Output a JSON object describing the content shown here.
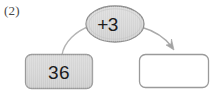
{
  "figure": {
    "type": "function-machine-diagram",
    "item_number": "(2)",
    "operator": {
      "label": "+3",
      "shape": "ellipse",
      "fill_color": "#d6d6d6",
      "border_color": "#8e8e8e"
    },
    "input_box": {
      "label": "36",
      "shape": "rounded-rectangle",
      "fill_color": "#d4d4d4",
      "border_color": "#9a9a9a"
    },
    "output_box": {
      "label": "",
      "shape": "rounded-rectangle",
      "fill_color": "#ffffff",
      "border_color": "#9a9a9a"
    },
    "connectors": [
      {
        "name": "input-to-operator",
        "from": "input_box",
        "to": "operator",
        "arrowhead": false,
        "color": "#b0b0b0"
      },
      {
        "name": "operator-to-output",
        "from": "operator",
        "to": "output_box",
        "arrowhead": true,
        "color": "#a8a8a8"
      }
    ]
  }
}
